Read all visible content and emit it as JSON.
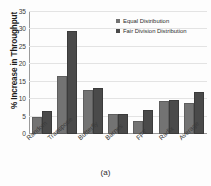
{
  "chart_data": {
    "type": "bar",
    "title": "",
    "xlabel": "",
    "ylabel": "% Increase in Throughput",
    "ylim": [
      0,
      35
    ],
    "yticks": [
      35,
      30,
      25,
      20,
      15,
      10,
      5,
      0
    ],
    "grid": true,
    "legend_position": "top-right",
    "categories": [
      "Random",
      "Transpose",
      "Butterfly",
      "Barnes",
      "FFT",
      "Radix",
      "Average"
    ],
    "series": [
      {
        "name": "Equal Distribution",
        "color": "#737373",
        "values": [
          4.2,
          16.2,
          12.0,
          5.1,
          3.2,
          9.0,
          8.3
        ]
      },
      {
        "name": "Fair Division Distribution",
        "color": "#4a4a4a",
        "values": [
          6.0,
          29.0,
          12.5,
          5.2,
          6.4,
          9.2,
          11.5
        ]
      }
    ],
    "caption": "(a)"
  }
}
